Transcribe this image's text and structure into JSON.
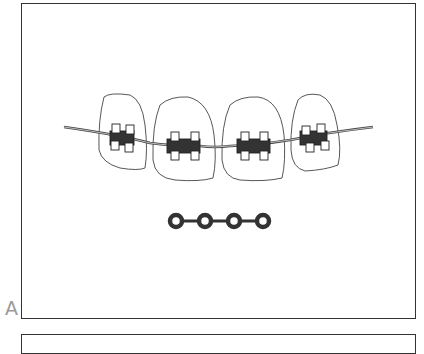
{
  "figure": {
    "panel_label": "A",
    "teeth_count": 4,
    "power_chain_rings": 4,
    "colors": {
      "line": "#333333",
      "label": "#9a9a9a",
      "background": "#ffffff"
    }
  }
}
